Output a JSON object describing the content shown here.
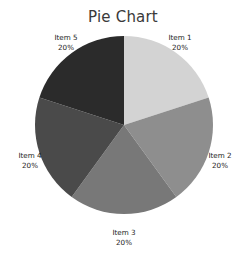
{
  "chart_data": {
    "type": "pie",
    "title": "Pie Chart",
    "xlabel": "",
    "ylabel": "",
    "legend_position": "none",
    "grid": false,
    "start_angle_deg": 90,
    "direction": "clockwise",
    "categories": [
      "Item 1",
      "Item 2",
      "Item 3",
      "Item 4",
      "Item 5"
    ],
    "values": [
      20,
      20,
      20,
      20,
      20
    ],
    "value_unit": "%",
    "slices": [
      {
        "label": "Item 1",
        "value": 20,
        "value_label": "20%",
        "color": "#d3d3d3",
        "angle_deg": 72
      },
      {
        "label": "Item 2",
        "value": 20,
        "value_label": "20%",
        "color": "#8e8e8e",
        "angle_deg": 72
      },
      {
        "label": "Item 3",
        "value": 20,
        "value_label": "20%",
        "color": "#787878",
        "angle_deg": 72
      },
      {
        "label": "Item 4",
        "value": 20,
        "value_label": "20%",
        "color": "#4a4a4a",
        "angle_deg": 72
      },
      {
        "label": "Item 5",
        "value": 20,
        "value_label": "20%",
        "color": "#2b2b2b",
        "angle_deg": 72
      }
    ]
  },
  "colors": {
    "background": "#ffffff",
    "title_text": "#3a3a3a",
    "label_text": "#1c1c1c"
  }
}
